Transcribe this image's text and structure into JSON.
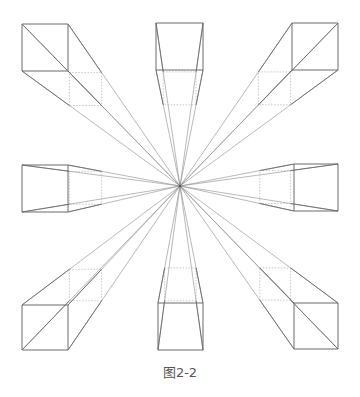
{
  "caption": "图2-2",
  "colors": {
    "line": "#6a6a6a",
    "ray": "#8a8a8a",
    "hidden": "#b0b0b0",
    "background": "#ffffff"
  },
  "vanishing_point": {
    "x": 180,
    "y": 186
  },
  "cubes": [
    {
      "name": "top-left",
      "front": [
        22,
        24,
        68,
        71
      ],
      "back": [
        42,
        43,
        82,
        86
      ]
    },
    {
      "name": "top-center",
      "front": [
        156,
        23,
        203,
        70
      ],
      "back": [
        161,
        70,
        199,
        84
      ]
    },
    {
      "name": "top-right",
      "front": [
        292,
        23,
        338,
        70
      ],
      "back": [
        280,
        42,
        318,
        84
      ]
    },
    {
      "name": "middle-left",
      "front": [
        22,
        165,
        68,
        212
      ],
      "back": [
        82,
        168,
        82,
        208
      ]
    },
    {
      "name": "middle-right",
      "front": [
        294,
        164,
        338,
        211
      ],
      "back": [
        280,
        167,
        280,
        209
      ]
    },
    {
      "name": "bottom-left",
      "front": [
        22,
        305,
        68,
        350
      ],
      "back": [
        42,
        290,
        82,
        330
      ]
    },
    {
      "name": "bottom-center",
      "front": [
        158,
        303,
        203,
        350
      ],
      "back": [
        161,
        290,
        200,
        290
      ]
    },
    {
      "name": "bottom-right",
      "front": [
        294,
        303,
        338,
        349
      ],
      "back": [
        280,
        290,
        318,
        330
      ]
    }
  ]
}
